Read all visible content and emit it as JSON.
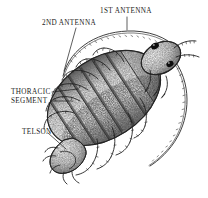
{
  "figure": {
    "style": "pen-and-ink stipple engraving",
    "background_color": "#ffffff",
    "ink_color": "#1a1a1a",
    "width": 208,
    "height": 198
  },
  "labels": {
    "first_antenna": "1ST ANTENNA",
    "second_antenna": "2ND ANTENNA",
    "thoracic": "THORACIC",
    "segment": "SEGMENT",
    "telson": "TELSON"
  },
  "leaders": {
    "first_antenna": "vertical-short-down",
    "second_antenna": "diagonal-down-left",
    "thoracic_segment": "two-horizontal-right",
    "telson": "diagonal-down-right"
  }
}
